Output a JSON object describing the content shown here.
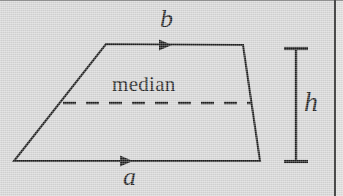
{
  "figure": {
    "type": "geometry-diagram",
    "background_color": "#d7d7d7",
    "stroke_color": "#1c1c1c",
    "labels": {
      "top_base": "b",
      "bottom_base": "a",
      "height": "h",
      "median": "median"
    },
    "shape": {
      "name": "trapezoid",
      "vertices": [
        {
          "name": "bottom-left",
          "x": 14,
          "y": 161
        },
        {
          "name": "top-left",
          "x": 106,
          "y": 44
        },
        {
          "name": "top-right",
          "x": 243,
          "y": 45
        },
        {
          "name": "bottom-right",
          "x": 260,
          "y": 161
        }
      ]
    },
    "median_line": {
      "style": "dashed",
      "from": {
        "x": 63,
        "y": 103
      },
      "to": {
        "x": 251,
        "y": 103
      }
    },
    "height_marker": {
      "style": "i-beam",
      "x": 296,
      "top_y": 48,
      "bottom_y": 162
    },
    "arrows": [
      {
        "on": "top_base",
        "direction": "right",
        "tip_x": 172,
        "y": 45
      },
      {
        "on": "bottom_base",
        "direction": "right",
        "tip_x": 133,
        "y": 161
      }
    ]
  }
}
